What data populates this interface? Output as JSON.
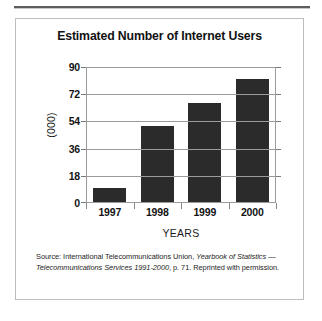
{
  "figure": {
    "title": "Estimated Number of Internet Users",
    "source_prefix": "Source: International Telecommunications Union, ",
    "source_italic_1": "Yearbook of Statistics — Telecommunications Services 1991-2000",
    "source_suffix": ", p. 71. Reprinted with permission."
  },
  "chart_data": {
    "type": "bar",
    "title": "Estimated Number of Internet Users",
    "categories": [
      "1997",
      "1998",
      "1999",
      "2000"
    ],
    "values": [
      10,
      51,
      66,
      82
    ],
    "xlabel": "YEARS",
    "ylabel": "(000)",
    "ylim": [
      0,
      90
    ],
    "yticks": [
      0,
      18,
      36,
      54,
      72,
      90
    ],
    "grid": true,
    "legend": "none",
    "bar_color": "#2b2b2b",
    "grid_color": "#9b9b9b"
  }
}
